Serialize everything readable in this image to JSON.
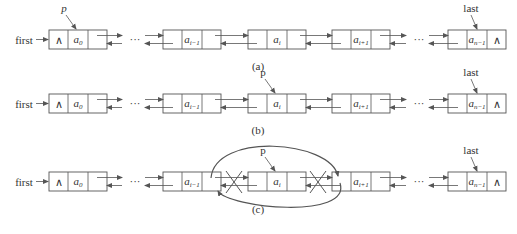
{
  "diagram": {
    "head_label": "first",
    "tail_label": "last",
    "null_symbol": "∧",
    "ellipsis": "···",
    "colors": {
      "stroke": "#555555",
      "arrow": "#666666",
      "background": "#ffffff"
    },
    "panels": [
      {
        "caption": "(a)",
        "pointer_label": "p",
        "pointer_target": "a0",
        "nodes": [
          {
            "id": "n0",
            "prev": "∧",
            "data": "a",
            "sub": "0",
            "next": ""
          },
          {
            "id": "n1",
            "prev": "",
            "data": "a",
            "sub": "i−1",
            "next": ""
          },
          {
            "id": "n2",
            "prev": "",
            "data": "a",
            "sub": "i",
            "next": ""
          },
          {
            "id": "n3",
            "prev": "",
            "data": "a",
            "sub": "i+1",
            "next": ""
          },
          {
            "id": "n4",
            "prev": "",
            "data": "a",
            "sub": "n−1",
            "next": "∧"
          }
        ]
      },
      {
        "caption": "(b)",
        "pointer_label": "p",
        "pointer_target": "a_i",
        "nodes": [
          {
            "id": "n0",
            "prev": "∧",
            "data": "a",
            "sub": "0",
            "next": ""
          },
          {
            "id": "n1",
            "prev": "",
            "data": "a",
            "sub": "i−1",
            "next": ""
          },
          {
            "id": "n2",
            "prev": "",
            "data": "a",
            "sub": "i",
            "next": ""
          },
          {
            "id": "n3",
            "prev": "",
            "data": "a",
            "sub": "i+1",
            "next": ""
          },
          {
            "id": "n4",
            "prev": "",
            "data": "a",
            "sub": "n−1",
            "next": "∧"
          }
        ]
      },
      {
        "caption": "(c)",
        "pointer_label": "p",
        "pointer_target": "a_i",
        "bypass_links": [
          "a_{i-1}.next → a_{i+1}",
          "a_{i+1}.prior → a_{i-1}"
        ],
        "crossed_links": [
          "a_{i-1} ↔ a_i",
          "a_i ↔ a_{i+1}"
        ],
        "nodes": [
          {
            "id": "n0",
            "prev": "∧",
            "data": "a",
            "sub": "0",
            "next": ""
          },
          {
            "id": "n1",
            "prev": "",
            "data": "a",
            "sub": "i−1",
            "next": ""
          },
          {
            "id": "n2",
            "prev": "",
            "data": "a",
            "sub": "i",
            "next": ""
          },
          {
            "id": "n3",
            "prev": "",
            "data": "a",
            "sub": "i+1",
            "next": ""
          },
          {
            "id": "n4",
            "prev": "",
            "data": "a",
            "sub": "n−1",
            "next": "∧"
          }
        ]
      }
    ]
  }
}
